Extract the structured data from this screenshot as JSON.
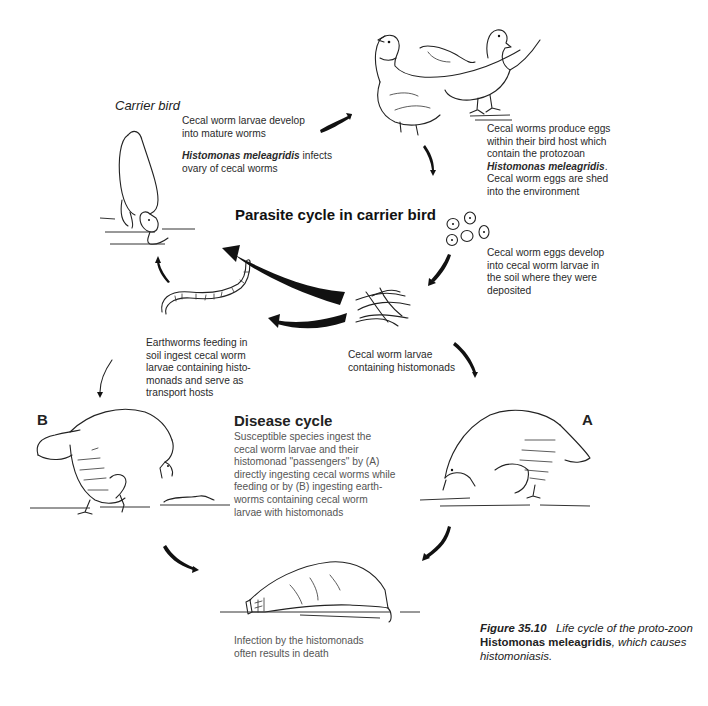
{
  "figure": {
    "caption": {
      "label": "Figure 35.10",
      "text_before": "Life cycle of the proto-zoon",
      "organism": "Histomonas meleagridis",
      "text_after": ", which causes histomoniasis."
    },
    "carrier_label": "Carrier bird",
    "parasite_cycle_title": "Parasite cycle in carrier bird",
    "disease_cycle_title": "Disease cycle",
    "letter_a": "A",
    "letter_b": "B",
    "stages": {
      "mature_worms": {
        "line1": "Cecal worm larvae develop",
        "line2": "into mature worms"
      },
      "infects_ovary": {
        "organism": "Histomonas meleagridis",
        "rest1": " infects",
        "line2": "ovary of cecal worms"
      },
      "produce_eggs": {
        "line1": "Cecal worms produce eggs",
        "line2": "within their bird host which",
        "line3": "contain the protozoan",
        "organism": "Histomonas meleagridis",
        "line5": "Cecal worm eggs are shed",
        "line6": "into the environment"
      },
      "eggs_develop": {
        "line1": "Cecal worm eggs develop",
        "line2": "into cecal worm larvae in",
        "line3": "the soil where they were",
        "line4": "deposited"
      },
      "larvae_histomonads": {
        "line1": "Cecal worm larvae",
        "line2": "containing histomonads"
      },
      "earthworms": {
        "line1": "Earthworms feeding in",
        "line2": "soil ingest cecal worm",
        "line3": "larvae containing histo-",
        "line4": "monads and serve as",
        "line5": "transport hosts"
      },
      "disease_desc": {
        "line1": "Susceptible species ingest the",
        "line2": "cecal worm larvae and their",
        "line3": "histomonad \"passengers\" by (A)",
        "line4": "directly ingesting cecal worms while",
        "line5": "feeding or by (B) ingesting earth-",
        "line6": "worms containing cecal worm",
        "line7": "larvae with histomonads"
      },
      "death": {
        "line1": "Infection by the histomonads",
        "line2": "often results in death"
      }
    },
    "illustrations": [
      "carrier-hen-pecking",
      "pheasant-pair",
      "cecal-worm-eggs",
      "cecal-worm-larvae-tangle",
      "earthworm",
      "turkey-b-eating-earthworm",
      "turkey-a-pecking-ground",
      "dead-turkey"
    ]
  }
}
